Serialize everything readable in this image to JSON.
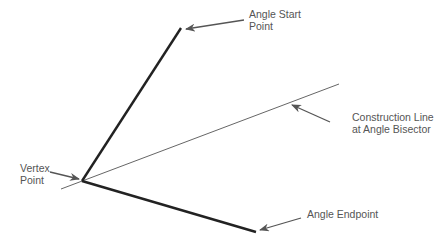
{
  "diagram": {
    "labels": {
      "angle_start_line1": "Angle Start",
      "angle_start_line2": "Point",
      "construction_line1": "Construction Line",
      "construction_line2": "at Angle Bisector",
      "vertex_line1": "Vertex",
      "vertex_line2": "Point",
      "angle_endpoint": "Angle Endpoint"
    },
    "colors": {
      "angle_lines": "#222222",
      "construction_line": "#555555",
      "leader_arrows": "#555555",
      "label_text": "#555555"
    }
  }
}
